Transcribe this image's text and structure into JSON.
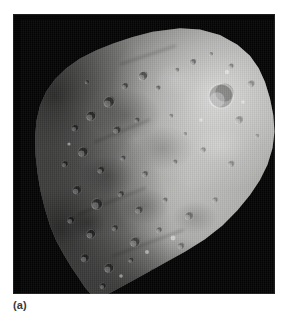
{
  "figure": {
    "caption": "(a)",
    "background_color": "#ffffff",
    "plate_color": "#040404",
    "body_color": "#9a9a98"
  },
  "plate": {
    "x": 13,
    "y": 14,
    "width": 262,
    "height": 280
  },
  "surface": {
    "illumination": "upper-right limb brightly lit; lower-left in shadow",
    "highlight_color": "#f2f2ee",
    "shadow_color": "#0a0a0a",
    "craters": [
      {
        "cx": 168,
        "cy": 38,
        "r": 3.0,
        "depth": 0.45
      },
      {
        "cx": 152,
        "cy": 46,
        "r": 2.2,
        "depth": 0.4
      },
      {
        "cx": 186,
        "cy": 30,
        "r": 2.0,
        "depth": 0.35
      },
      {
        "cx": 206,
        "cy": 42,
        "r": 2.6,
        "depth": 0.35
      },
      {
        "cx": 118,
        "cy": 52,
        "r": 4.2,
        "depth": 0.55
      },
      {
        "cx": 100,
        "cy": 62,
        "r": 3.0,
        "depth": 0.55
      },
      {
        "cx": 133,
        "cy": 64,
        "r": 2.4,
        "depth": 0.45
      },
      {
        "cx": 196,
        "cy": 72,
        "r": 11.5,
        "depth": 0.38
      },
      {
        "cx": 226,
        "cy": 60,
        "r": 3.4,
        "depth": 0.3
      },
      {
        "cx": 214,
        "cy": 96,
        "r": 3.8,
        "depth": 0.28
      },
      {
        "cx": 84,
        "cy": 78,
        "r": 5.0,
        "depth": 0.6
      },
      {
        "cx": 66,
        "cy": 92,
        "r": 4.4,
        "depth": 0.62
      },
      {
        "cx": 50,
        "cy": 104,
        "r": 3.2,
        "depth": 0.62
      },
      {
        "cx": 92,
        "cy": 106,
        "r": 3.6,
        "depth": 0.5
      },
      {
        "cx": 112,
        "cy": 96,
        "r": 2.6,
        "depth": 0.45
      },
      {
        "cx": 146,
        "cy": 92,
        "r": 2.2,
        "depth": 0.35
      },
      {
        "cx": 58,
        "cy": 128,
        "r": 4.6,
        "depth": 0.6
      },
      {
        "cx": 40,
        "cy": 140,
        "r": 3.0,
        "depth": 0.62
      },
      {
        "cx": 76,
        "cy": 146,
        "r": 3.4,
        "depth": 0.55
      },
      {
        "cx": 98,
        "cy": 134,
        "r": 2.6,
        "depth": 0.48
      },
      {
        "cx": 120,
        "cy": 150,
        "r": 3.0,
        "depth": 0.42
      },
      {
        "cx": 150,
        "cy": 138,
        "r": 2.4,
        "depth": 0.35
      },
      {
        "cx": 178,
        "cy": 126,
        "r": 2.8,
        "depth": 0.3
      },
      {
        "cx": 206,
        "cy": 140,
        "r": 3.2,
        "depth": 0.28
      },
      {
        "cx": 52,
        "cy": 166,
        "r": 4.0,
        "depth": 0.6
      },
      {
        "cx": 72,
        "cy": 180,
        "r": 5.2,
        "depth": 0.55
      },
      {
        "cx": 96,
        "cy": 170,
        "r": 3.0,
        "depth": 0.5
      },
      {
        "cx": 114,
        "cy": 186,
        "r": 3.6,
        "depth": 0.45
      },
      {
        "cx": 140,
        "cy": 176,
        "r": 2.6,
        "depth": 0.38
      },
      {
        "cx": 164,
        "cy": 192,
        "r": 3.8,
        "depth": 0.34
      },
      {
        "cx": 190,
        "cy": 176,
        "r": 2.8,
        "depth": 0.3
      },
      {
        "cx": 46,
        "cy": 196,
        "r": 3.4,
        "depth": 0.62
      },
      {
        "cx": 66,
        "cy": 210,
        "r": 4.2,
        "depth": 0.58
      },
      {
        "cx": 90,
        "cy": 204,
        "r": 3.0,
        "depth": 0.52
      },
      {
        "cx": 110,
        "cy": 218,
        "r": 4.6,
        "depth": 0.46
      },
      {
        "cx": 134,
        "cy": 206,
        "r": 2.8,
        "depth": 0.4
      },
      {
        "cx": 156,
        "cy": 222,
        "r": 3.2,
        "depth": 0.34
      },
      {
        "cx": 60,
        "cy": 234,
        "r": 3.8,
        "depth": 0.58
      },
      {
        "cx": 84,
        "cy": 244,
        "r": 4.4,
        "depth": 0.52
      },
      {
        "cx": 106,
        "cy": 236,
        "r": 2.6,
        "depth": 0.46
      },
      {
        "cx": 128,
        "cy": 248,
        "r": 3.4,
        "depth": 0.4
      },
      {
        "cx": 78,
        "cy": 262,
        "r": 3.0,
        "depth": 0.54
      },
      {
        "cx": 100,
        "cy": 266,
        "r": 2.4,
        "depth": 0.48
      },
      {
        "cx": 62,
        "cy": 58,
        "r": 2.0,
        "depth": 0.55
      },
      {
        "cx": 160,
        "cy": 110,
        "r": 2.0,
        "depth": 0.32
      },
      {
        "cx": 232,
        "cy": 112,
        "r": 2.2,
        "depth": 0.26
      }
    ],
    "bright_spots": [
      {
        "cx": 202,
        "cy": 48,
        "r": 2.2
      },
      {
        "cx": 176,
        "cy": 96,
        "r": 1.8
      },
      {
        "cx": 148,
        "cy": 214,
        "r": 2.4
      },
      {
        "cx": 122,
        "cy": 228,
        "r": 2.0
      },
      {
        "cx": 96,
        "cy": 252,
        "r": 1.8
      },
      {
        "cx": 44,
        "cy": 120,
        "r": 1.6
      },
      {
        "cx": 218,
        "cy": 78,
        "r": 1.8
      }
    ],
    "grooves": [
      {
        "x1": 96,
        "y1": 40,
        "x2": 150,
        "y2": 22
      },
      {
        "x1": 70,
        "y1": 118,
        "x2": 124,
        "y2": 96
      },
      {
        "x1": 54,
        "y1": 190,
        "x2": 120,
        "y2": 164
      },
      {
        "x1": 88,
        "y1": 232,
        "x2": 158,
        "y2": 206
      }
    ]
  }
}
